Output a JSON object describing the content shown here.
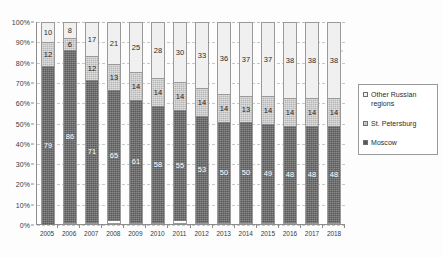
{
  "chart_data": {
    "type": "bar",
    "title": "",
    "subtitle": "",
    "xlabel": "",
    "ylabel": "",
    "stacked": true,
    "stack_mode": "percent",
    "grid": true,
    "legend_position": "right",
    "ylim": [
      0,
      100
    ],
    "y_ticks": [
      "0%",
      "10%",
      "20%",
      "30%",
      "40%",
      "50%",
      "60%",
      "70%",
      "80%",
      "90%",
      "100%"
    ],
    "categories": [
      "2005",
      "2006",
      "2007",
      "2008",
      "2009",
      "2010",
      "2011",
      "2012",
      "2013",
      "2014",
      "2015",
      "2016",
      "2017",
      "2018"
    ],
    "series": [
      {
        "name": "Moscow",
        "color": "#5a5a5a",
        "values": [
          79,
          86,
          71,
          65,
          61,
          58,
          55,
          53,
          50,
          50,
          49,
          48,
          48,
          48
        ]
      },
      {
        "name": "St. Petersburg",
        "color": "#b6b6b6",
        "values": [
          12,
          6,
          12,
          13,
          14,
          14,
          14,
          14,
          14,
          13,
          14,
          14,
          14,
          14
        ]
      },
      {
        "name": "Other Russian regions",
        "color": "#f0f0f0",
        "values": [
          10,
          8,
          17,
          21,
          25,
          28,
          30,
          33,
          36,
          37,
          37,
          38,
          38,
          38
        ]
      }
    ]
  },
  "legend": {
    "items": [
      {
        "label": "Other Russian regions",
        "swatch": "sw-other"
      },
      {
        "label": "St. Petersburg",
        "swatch": "sw-spb"
      },
      {
        "label": "Moscow",
        "swatch": "sw-moscow"
      }
    ]
  }
}
